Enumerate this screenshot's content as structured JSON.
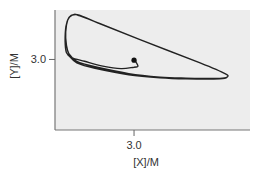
{
  "chart_data": {
    "type": "line",
    "title": "",
    "xlabel": "[X]/M",
    "ylabel": "[Y]/M",
    "xlim": [
      -0.04,
      7.46
    ],
    "ylim": [
      -0.85,
      5.7
    ],
    "xticks": [
      {
        "value": 3.0,
        "label": "3.0"
      }
    ],
    "yticks": [
      {
        "value": 3.0,
        "label": "3.0"
      }
    ],
    "grid": false,
    "legend": "none",
    "colors": {
      "background": "#ededed",
      "line": "#222222",
      "axis": "#777777",
      "marker": "#111111"
    },
    "start_point": {
      "x": 3.0,
      "y": 2.96
    },
    "series": [
      {
        "name": "trajectory",
        "points": [
          [
            3.0,
            2.96
          ],
          [
            3.08,
            2.85
          ],
          [
            3.15,
            2.62
          ],
          [
            3.0,
            2.58
          ],
          [
            2.5,
            2.5
          ],
          [
            1.8,
            2.64
          ],
          [
            1.1,
            2.9
          ],
          [
            0.6,
            3.1
          ],
          [
            0.4,
            3.38
          ],
          [
            0.35,
            4.0
          ],
          [
            0.38,
            4.8
          ],
          [
            0.5,
            5.3
          ],
          [
            0.7,
            5.46
          ],
          [
            0.92,
            5.38
          ],
          [
            1.7,
            4.95
          ],
          [
            3.23,
            4.08
          ],
          [
            5.54,
            2.81
          ],
          [
            6.5,
            2.23
          ],
          [
            6.58,
            2.04
          ],
          [
            6.3,
            1.96
          ],
          [
            5.0,
            1.98
          ],
          [
            4.0,
            2.04
          ],
          [
            2.8,
            2.23
          ],
          [
            1.5,
            2.6
          ],
          [
            0.8,
            2.9
          ],
          [
            0.5,
            3.3
          ],
          [
            0.4,
            3.8
          ],
          [
            0.37,
            4.5
          ],
          [
            0.45,
            5.15
          ],
          [
            0.62,
            5.42
          ],
          [
            0.9,
            5.42
          ],
          [
            1.6,
            5.0
          ],
          [
            3.23,
            4.08
          ],
          [
            5.54,
            2.81
          ],
          [
            6.5,
            2.23
          ],
          [
            6.58,
            2.04
          ],
          [
            6.3,
            1.94
          ],
          [
            5.0,
            1.94
          ],
          [
            4.0,
            2.0
          ],
          [
            2.8,
            2.17
          ],
          [
            1.5,
            2.52
          ],
          [
            0.8,
            2.82
          ],
          [
            0.5,
            3.2
          ]
        ]
      }
    ]
  }
}
